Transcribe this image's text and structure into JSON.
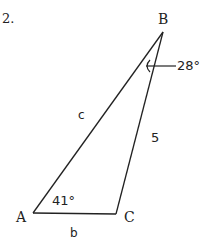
{
  "problem": {
    "number": "2.",
    "vertices": {
      "A": "A",
      "B": "B",
      "C": "C"
    },
    "sides": {
      "c": "c",
      "a": "5",
      "b": "b"
    },
    "angles": {
      "A": "41°",
      "B": "28°"
    }
  }
}
